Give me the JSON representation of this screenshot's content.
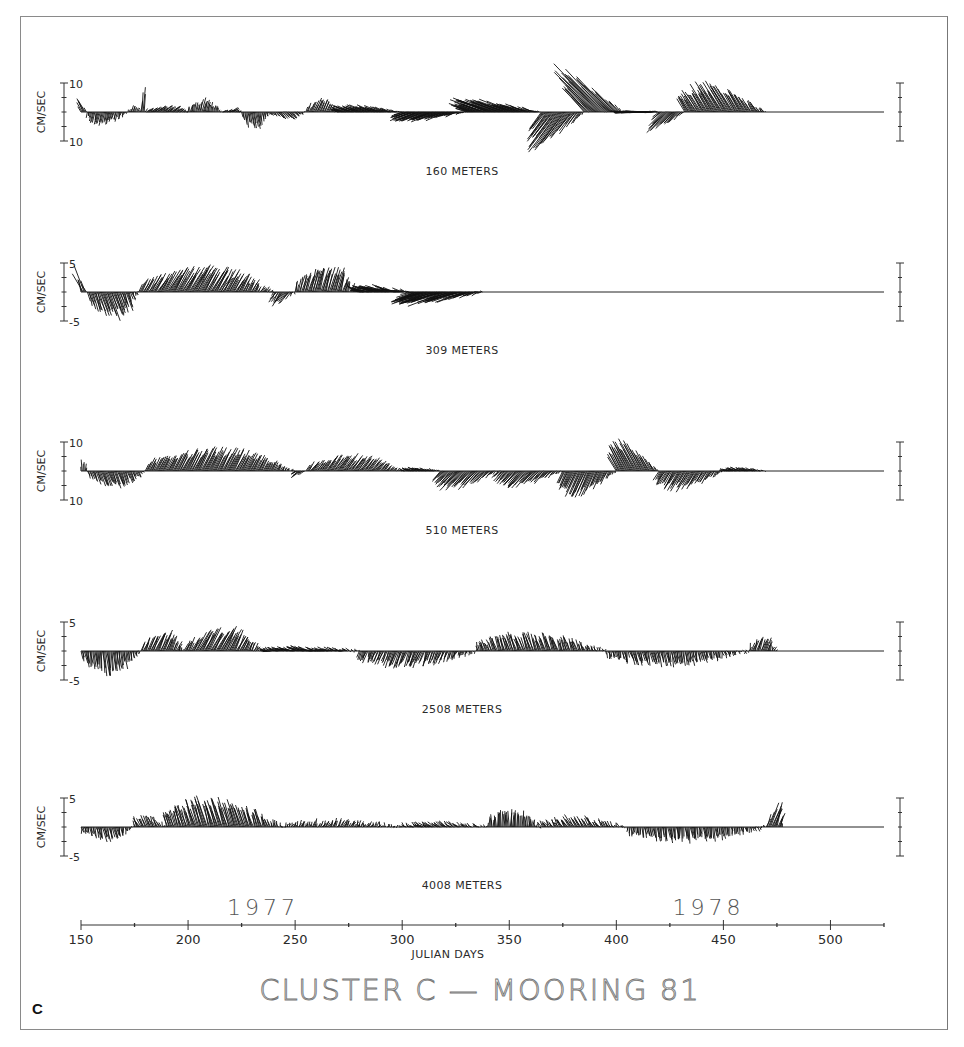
{
  "figure": {
    "title": "CLUSTER C  —  MOORING 81",
    "panel_letter": "C",
    "x_axis_label": "JULIAN DAYS",
    "year_labels": [
      {
        "label": "1977",
        "day": 235
      },
      {
        "label": "1978",
        "day": 443
      }
    ]
  },
  "chart_data": {
    "type": "stick-plot (current vector time series)",
    "title": "CLUSTER C — MOORING 81",
    "xlabel": "JULIAN DAYS",
    "ylabel": "CM/SEC",
    "x_range": [
      150,
      525
    ],
    "x_ticks": [
      150,
      200,
      250,
      300,
      350,
      400,
      450,
      500
    ],
    "x_minor_ticks": [
      175,
      225,
      275,
      325,
      375,
      425,
      475,
      525
    ],
    "years": {
      "1977": "days 150-365",
      "1978": "days 366-525"
    },
    "grid": false,
    "series": [
      {
        "name": "160 METERS",
        "depth_m": 160,
        "y_scale_cm_s": [
          -10,
          10
        ],
        "y_tick_labels": [
          "10",
          "10"
        ],
        "data_end_day": 470,
        "segments": [
          {
            "from": 150,
            "to": 153,
            "u": -3,
            "v": 5
          },
          {
            "from": 153,
            "to": 172,
            "u": -1,
            "v": -4
          },
          {
            "from": 172,
            "to": 178,
            "u": 1,
            "v": 2
          },
          {
            "from": 178,
            "to": 180,
            "u": 0.5,
            "v": 8
          },
          {
            "from": 180,
            "to": 200,
            "u": 3,
            "v": 2
          },
          {
            "from": 200,
            "to": 216,
            "u": 1,
            "v": 4
          },
          {
            "from": 216,
            "to": 225,
            "u": 2,
            "v": 1
          },
          {
            "from": 225,
            "to": 238,
            "u": 1,
            "v": -5
          },
          {
            "from": 238,
            "to": 255,
            "u": 2,
            "v": -2
          },
          {
            "from": 255,
            "to": 270,
            "u": 2,
            "v": 4
          },
          {
            "from": 270,
            "to": 300,
            "u": -6,
            "v": 2
          },
          {
            "from": 300,
            "to": 330,
            "u": -9,
            "v": -3
          },
          {
            "from": 330,
            "to": 365,
            "u": -12,
            "v": 4
          },
          {
            "from": 365,
            "to": 385,
            "u": -10,
            "v": -12
          },
          {
            "from": 385,
            "to": 403,
            "u": -15,
            "v": 14
          },
          {
            "from": 403,
            "to": 420,
            "u": -8,
            "v": 0
          },
          {
            "from": 420,
            "to": 432,
            "u": -7,
            "v": -6
          },
          {
            "from": 432,
            "to": 470,
            "u": -6,
            "v": 9
          }
        ]
      },
      {
        "name": "309 METERS",
        "depth_m": 309,
        "y_scale_cm_s": [
          -5,
          5
        ],
        "y_tick_labels": [
          "5",
          "-5"
        ],
        "data_end_day": 338,
        "segments": [
          {
            "from": 150,
            "to": 153,
            "u": -2,
            "v": 4
          },
          {
            "from": 153,
            "to": 177,
            "u": 1.5,
            "v": -4
          },
          {
            "from": 177,
            "to": 240,
            "u": 2.5,
            "v": 4
          },
          {
            "from": 240,
            "to": 250,
            "u": -1.5,
            "v": -2
          },
          {
            "from": 250,
            "to": 280,
            "u": 1.2,
            "v": 4
          },
          {
            "from": 280,
            "to": 305,
            "u": -4,
            "v": 1
          },
          {
            "from": 305,
            "to": 338,
            "u": -7,
            "v": -2
          }
        ]
      },
      {
        "name": "510 METERS",
        "depth_m": 510,
        "y_scale_cm_s": [
          -10,
          10
        ],
        "y_tick_labels": [
          "10",
          "10"
        ],
        "data_end_day": 470,
        "segments": [
          {
            "from": 150,
            "to": 153,
            "u": 0,
            "v": 4
          },
          {
            "from": 153,
            "to": 180,
            "u": 2,
            "v": -5
          },
          {
            "from": 180,
            "to": 250,
            "u": 4,
            "v": 7
          },
          {
            "from": 250,
            "to": 255,
            "u": -3,
            "v": -2
          },
          {
            "from": 255,
            "to": 300,
            "u": 4,
            "v": 5
          },
          {
            "from": 300,
            "to": 318,
            "u": -3,
            "v": 1
          },
          {
            "from": 318,
            "to": 345,
            "u": -6,
            "v": -6
          },
          {
            "from": 345,
            "to": 375,
            "u": -5,
            "v": -5
          },
          {
            "from": 375,
            "to": 400,
            "u": -4,
            "v": -8
          },
          {
            "from": 400,
            "to": 420,
            "u": -6,
            "v": 10
          },
          {
            "from": 420,
            "to": 450,
            "u": -4,
            "v": -6
          },
          {
            "from": 450,
            "to": 470,
            "u": -3,
            "v": 1
          }
        ]
      },
      {
        "name": "2508 METERS",
        "depth_m": 2508,
        "y_scale_cm_s": [
          -5,
          5
        ],
        "y_tick_labels": [
          "5",
          "-5"
        ],
        "data_end_day": 475,
        "segments": [
          {
            "from": 150,
            "to": 178,
            "u": 0.5,
            "v": -3.5
          },
          {
            "from": 178,
            "to": 198,
            "u": 1.5,
            "v": 3
          },
          {
            "from": 198,
            "to": 235,
            "u": 2,
            "v": 3.5
          },
          {
            "from": 235,
            "to": 280,
            "u": -2,
            "v": 0.5
          },
          {
            "from": 280,
            "to": 335,
            "u": -1,
            "v": -2.5
          },
          {
            "from": 335,
            "to": 395,
            "u": -1,
            "v": 2.8
          },
          {
            "from": 395,
            "to": 462,
            "u": 0.5,
            "v": -2.2
          },
          {
            "from": 462,
            "to": 475,
            "u": 0.7,
            "v": 2
          }
        ]
      },
      {
        "name": "4008 METERS",
        "depth_m": 4008,
        "y_scale_cm_s": [
          -5,
          5
        ],
        "y_tick_labels": [
          "5",
          "-5"
        ],
        "data_end_day": 475,
        "segments": [
          {
            "from": 150,
            "to": 175,
            "u": 0.5,
            "v": -2
          },
          {
            "from": 175,
            "to": 190,
            "u": -1,
            "v": 2
          },
          {
            "from": 190,
            "to": 245,
            "u": -1.5,
            "v": 4.5
          },
          {
            "from": 245,
            "to": 300,
            "u": 0.5,
            "v": 1
          },
          {
            "from": 300,
            "to": 340,
            "u": -1,
            "v": 0.7
          },
          {
            "from": 340,
            "to": 365,
            "u": 0,
            "v": 2.7
          },
          {
            "from": 365,
            "to": 405,
            "u": -1,
            "v": 1.5
          },
          {
            "from": 405,
            "to": 470,
            "u": 0.3,
            "v": -2.2
          },
          {
            "from": 470,
            "to": 478,
            "u": 1.5,
            "v": 4
          }
        ]
      }
    ]
  }
}
